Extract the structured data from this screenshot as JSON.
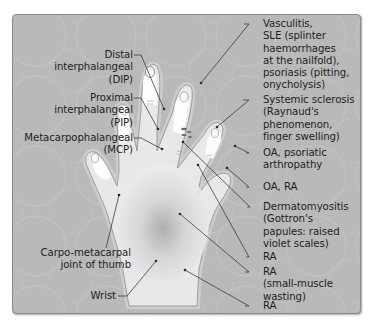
{
  "diagram": {
    "colors": {
      "background": "#b9b9b9",
      "hand_fill": "#e9e9e9",
      "nail_highlight": "#ffffff",
      "leader_line": "#2a2a2a",
      "text": "#1e1e1e"
    },
    "left_labels": [
      {
        "id": "dip",
        "text": "Distal\ninterphalangeal\n(DIP)"
      },
      {
        "id": "pip",
        "text": "Proximal\ninterphalangeal\n(PIP)"
      },
      {
        "id": "mcp",
        "text": "Metacarpophalangeal\n(MCP)"
      },
      {
        "id": "cmc",
        "text": "Carpo-metacarpal\njoint of thumb"
      },
      {
        "id": "wrist",
        "text": "Wrist"
      }
    ],
    "right_labels": [
      {
        "id": "nails",
        "text": "Vasculitis,\nSLE (splinter\nhaemorrhages\nat the nailfold),\npsoriasis (pitting,\nonycholysis)"
      },
      {
        "id": "ssc",
        "text": "Systemic sclerosis\n(Raynaud's\nphenomenon,\nfinger swelling)"
      },
      {
        "id": "oa_psa",
        "text": "OA, psoriatic\narthropathy"
      },
      {
        "id": "oa_ra",
        "text": "OA, RA"
      },
      {
        "id": "dm",
        "text": "Dermatomyositis\n(Gottron's\npapules: raised\nviolet scales)"
      },
      {
        "id": "ra1",
        "text": "RA"
      },
      {
        "id": "ra2",
        "text": "RA\n(small-muscle\nwasting)"
      },
      {
        "id": "ra3",
        "text": "RA"
      }
    ]
  }
}
